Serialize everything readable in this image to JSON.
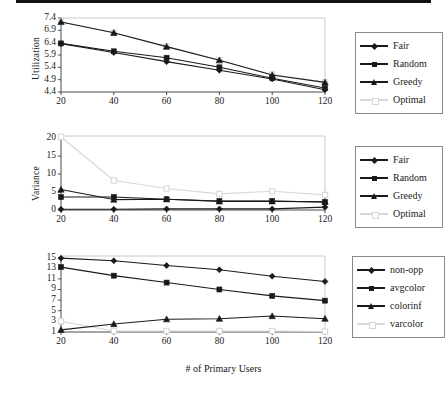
{
  "figure": {
    "xlabel": "# of Primary Users",
    "colors": {
      "dark": "#1a1a1a",
      "light": "#d8d8d8",
      "axis": "#4a4a4a",
      "frame": "#c9c9c9",
      "legend_border": "#8a8a8a"
    }
  },
  "chart_data": [
    {
      "type": "line",
      "title": "",
      "xlabel": "# of Primary Users",
      "ylabel": "Utilization",
      "x": [
        20,
        40,
        60,
        80,
        100,
        120
      ],
      "xticklabels": [
        "20",
        "40",
        "60",
        "80",
        "100",
        "120"
      ],
      "yticks": [
        4.4,
        4.9,
        5.4,
        5.9,
        6.4,
        6.9,
        7.4
      ],
      "yticklabels": [
        "4.4",
        "4.9",
        "5.4",
        "5.9",
        "6.4",
        "6.9",
        "7.4"
      ],
      "xlim": [
        20,
        120
      ],
      "ylim": [
        4.4,
        7.4
      ],
      "grid": false,
      "legend_position": "right",
      "series": [
        {
          "name": "Fair",
          "marker": "diamond",
          "color": "#1a1a1a",
          "values": [
            6.36,
            6.0,
            5.63,
            5.28,
            4.93,
            4.49
          ]
        },
        {
          "name": "Random",
          "marker": "square",
          "color": "#1a1a1a",
          "values": [
            6.37,
            6.05,
            5.79,
            5.4,
            4.96,
            4.56
          ]
        },
        {
          "name": "Greedy",
          "marker": "triangle",
          "color": "#1a1a1a",
          "values": [
            7.24,
            6.8,
            6.24,
            5.69,
            5.09,
            4.79
          ]
        },
        {
          "name": "Optimal",
          "marker": "osquare",
          "color": "#d8d8d8",
          "values": [
            7.25,
            6.8,
            6.24,
            5.69,
            5.11,
            4.8
          ]
        }
      ]
    },
    {
      "type": "line",
      "title": "",
      "xlabel": "# of Primary Users",
      "ylabel": "Variance",
      "x": [
        20,
        40,
        60,
        80,
        100,
        120
      ],
      "xticklabels": [
        "20",
        "40",
        "60",
        "80",
        "100",
        "120"
      ],
      "yticks": [
        0,
        5,
        10,
        15,
        20
      ],
      "yticklabels": [
        "0",
        "5",
        "10",
        "15",
        "20"
      ],
      "xlim": [
        20,
        120
      ],
      "ylim": [
        0,
        20.6
      ],
      "grid": false,
      "legend_position": "right",
      "series": [
        {
          "name": "Fair",
          "marker": "diamond",
          "color": "#1a1a1a",
          "values": [
            0.2,
            0.2,
            0.3,
            0.3,
            0.3,
            0.8
          ]
        },
        {
          "name": "Random",
          "marker": "square",
          "color": "#1a1a1a",
          "values": [
            3.6,
            3.6,
            3.0,
            2.5,
            2.5,
            2.2
          ]
        },
        {
          "name": "Greedy",
          "marker": "triangle",
          "color": "#1a1a1a",
          "values": [
            5.7,
            2.9,
            3.0,
            2.4,
            2.4,
            2.3
          ]
        },
        {
          "name": "Optimal",
          "marker": "osquare",
          "color": "#d8d8d8",
          "values": [
            20.4,
            8.2,
            6.0,
            4.5,
            5.2,
            4.2
          ]
        }
      ]
    },
    {
      "type": "line",
      "title": "",
      "xlabel": "# of Primary Users",
      "ylabel": "",
      "x": [
        20,
        40,
        60,
        80,
        100,
        120
      ],
      "xticklabels": [
        "20",
        "40",
        "60",
        "80",
        "100",
        "120"
      ],
      "yticks": [
        1,
        3,
        5,
        7,
        9,
        11,
        13,
        15
      ],
      "yticklabels": [
        "1",
        "3",
        "5",
        "7",
        "9",
        "11",
        "13",
        "15"
      ],
      "xlim": [
        20,
        120
      ],
      "ylim": [
        1,
        15.3
      ],
      "grid": false,
      "legend_position": "right",
      "series": [
        {
          "name": "non-opp",
          "marker": "diamond",
          "color": "#1a1a1a",
          "values": [
            14.9,
            14.4,
            13.5,
            12.7,
            11.5,
            10.5
          ]
        },
        {
          "name": "avgcolor",
          "marker": "square",
          "color": "#1a1a1a",
          "values": [
            13.2,
            11.6,
            10.3,
            9.0,
            7.8,
            6.9
          ]
        },
        {
          "name": "colorinf",
          "marker": "triangle",
          "color": "#1a1a1a",
          "values": [
            1.4,
            2.5,
            3.4,
            3.5,
            4.0,
            3.5
          ]
        },
        {
          "name": "varcolor",
          "marker": "osquare",
          "color": "#d8d8d8",
          "values": [
            3.0,
            1.2,
            1.2,
            1.2,
            1.2,
            1.1
          ]
        }
      ]
    }
  ]
}
